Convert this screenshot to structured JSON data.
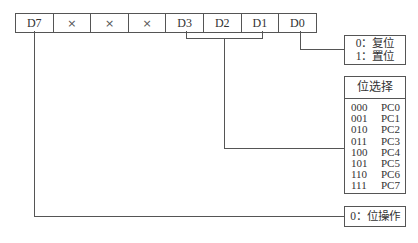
{
  "register": {
    "bits": [
      {
        "label": "D7",
        "type": "bit"
      },
      {
        "label": "×",
        "type": "x"
      },
      {
        "label": "×",
        "type": "x"
      },
      {
        "label": "×",
        "type": "x"
      },
      {
        "label": "D3",
        "type": "bit"
      },
      {
        "label": "D2",
        "type": "bit"
      },
      {
        "label": "D1",
        "type": "bit"
      },
      {
        "label": "D0",
        "type": "bit"
      }
    ]
  },
  "d0_box": {
    "lines": [
      "0：复位",
      "1：置位"
    ]
  },
  "bit_select": {
    "title": "位选择",
    "rows": [
      {
        "code": "000",
        "port": "PC0"
      },
      {
        "code": "001",
        "port": "PC1"
      },
      {
        "code": "010",
        "port": "PC2"
      },
      {
        "code": "011",
        "port": "PC3"
      },
      {
        "code": "100",
        "port": "PC4"
      },
      {
        "code": "101",
        "port": "PC5"
      },
      {
        "code": "110",
        "port": "PC6"
      },
      {
        "code": "111",
        "port": "PC7"
      }
    ]
  },
  "d7_box": {
    "label": "0：位操作"
  }
}
